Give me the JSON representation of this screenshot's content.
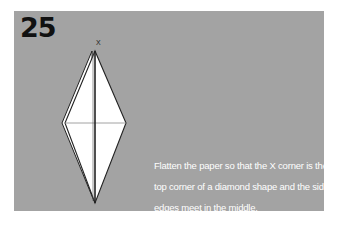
{
  "step": {
    "number": "25"
  },
  "diagram": {
    "marker_label": "X",
    "fill": "#ffffff",
    "stroke": "#222222",
    "crease": "#8a8a8a"
  },
  "caption": {
    "lines": [
      "Flatten the paper so that the X corner is the",
      "top corner of a diamond shape and the side",
      "edges meet in the middle."
    ]
  },
  "colors": {
    "panel": "#a3a3a3",
    "background": "#ffffff",
    "text": "#ffffff",
    "step_number": "#111111"
  }
}
